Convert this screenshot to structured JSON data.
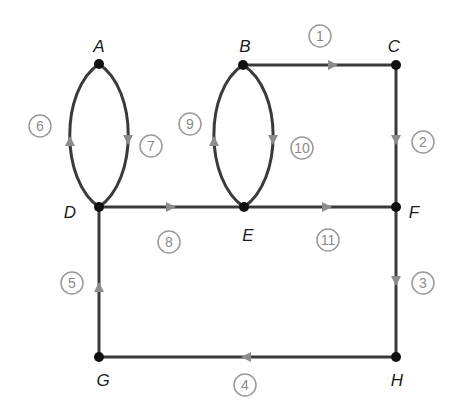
{
  "diagram": {
    "type": "directed-graph",
    "colors": {
      "edge": "#3a3a3a",
      "arrow": "#8c8c8c",
      "node": "#111111",
      "label_circle": "#9a9a9a"
    },
    "nodes": [
      {
        "id": "A",
        "label": "A",
        "x": 99,
        "y": 64,
        "lx": 99,
        "ly": 52
      },
      {
        "id": "B",
        "label": "B",
        "x": 243,
        "y": 65,
        "lx": 245,
        "ly": 52
      },
      {
        "id": "C",
        "label": "C",
        "x": 396,
        "y": 65,
        "lx": 394,
        "ly": 52
      },
      {
        "id": "D",
        "label": "D",
        "x": 99,
        "y": 207,
        "lx": 70,
        "ly": 218
      },
      {
        "id": "E",
        "label": "E",
        "x": 244,
        "y": 207,
        "lx": 248,
        "ly": 241
      },
      {
        "id": "F",
        "label": "F",
        "x": 396,
        "y": 207,
        "lx": 414,
        "ly": 218
      },
      {
        "id": "G",
        "label": "G",
        "x": 99,
        "y": 357,
        "lx": 103,
        "ly": 386
      },
      {
        "id": "H",
        "label": "H",
        "x": 396,
        "y": 357,
        "lx": 397,
        "ly": 386
      }
    ],
    "edges": [
      {
        "id": 1,
        "from": "B",
        "to": "C",
        "num": "1",
        "nx": 320,
        "ny": 36
      },
      {
        "id": 2,
        "from": "C",
        "to": "F",
        "num": "2",
        "nx": 423,
        "ny": 142
      },
      {
        "id": 3,
        "from": "F",
        "to": "H",
        "num": "3",
        "nx": 423,
        "ny": 283
      },
      {
        "id": 4,
        "from": "H",
        "to": "G",
        "num": "4",
        "nx": 245,
        "ny": 385
      },
      {
        "id": 5,
        "from": "G",
        "to": "D",
        "num": "5",
        "nx": 72,
        "ny": 283
      },
      {
        "id": 6,
        "from": "D",
        "to": "A",
        "num": "6",
        "nx": 40,
        "ny": 126
      },
      {
        "id": 7,
        "from": "A",
        "to": "D",
        "num": "7",
        "nx": 151,
        "ny": 146
      },
      {
        "id": 8,
        "from": "D",
        "to": "E",
        "num": "8",
        "nx": 169,
        "ny": 242
      },
      {
        "id": 9,
        "from": "E",
        "to": "B",
        "num": "9",
        "nx": 190,
        "ny": 124
      },
      {
        "id": 10,
        "from": "B",
        "to": "E",
        "num": "10",
        "nx": 302,
        "ny": 148
      },
      {
        "id": 11,
        "from": "E",
        "to": "F",
        "num": "11",
        "nx": 328,
        "ny": 240
      }
    ]
  }
}
